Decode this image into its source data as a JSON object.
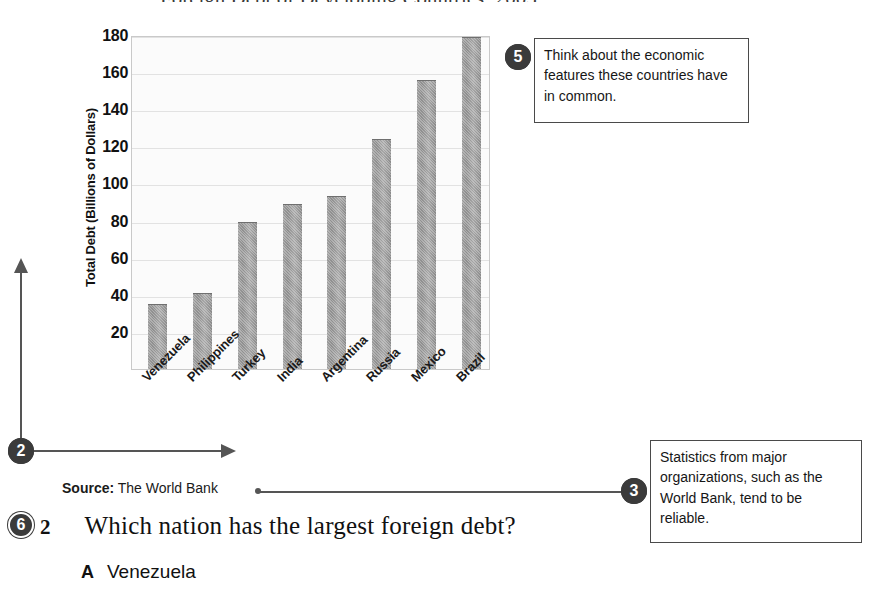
{
  "page": {
    "top_cutoff_text": "Foreign Debt of Developing Countries, 2003"
  },
  "chart_data": {
    "type": "bar",
    "title": "",
    "xlabel": "",
    "ylabel": "Total Debt (Billions of Dollars)",
    "categories": [
      "Venezuela",
      "Philippines",
      "Turkey",
      "India",
      "Argentina",
      "Russia",
      "Mexico",
      "Brazil"
    ],
    "values": [
      35,
      41,
      79,
      89,
      93,
      124,
      156,
      179
    ],
    "ylim": [
      0,
      180
    ],
    "yticks": [
      20,
      40,
      60,
      80,
      100,
      120,
      140,
      160,
      180
    ],
    "grid": true,
    "legend": "none",
    "bar_color": "#979797"
  },
  "source": {
    "label": "Source:",
    "value": "The World Bank"
  },
  "callouts": [
    {
      "number": "2",
      "text": ""
    },
    {
      "number": "3",
      "text": "Statistics from major organizations, such as the World Bank, tend to be reliable."
    },
    {
      "number": "5",
      "text": "Think about the economic features these countries have in common."
    },
    {
      "number": "6",
      "text": ""
    }
  ],
  "question": {
    "number": "2",
    "text": "Which nation has the largest foreign debt?",
    "choices": [
      {
        "letter": "A",
        "text": "Venezuela"
      }
    ]
  }
}
